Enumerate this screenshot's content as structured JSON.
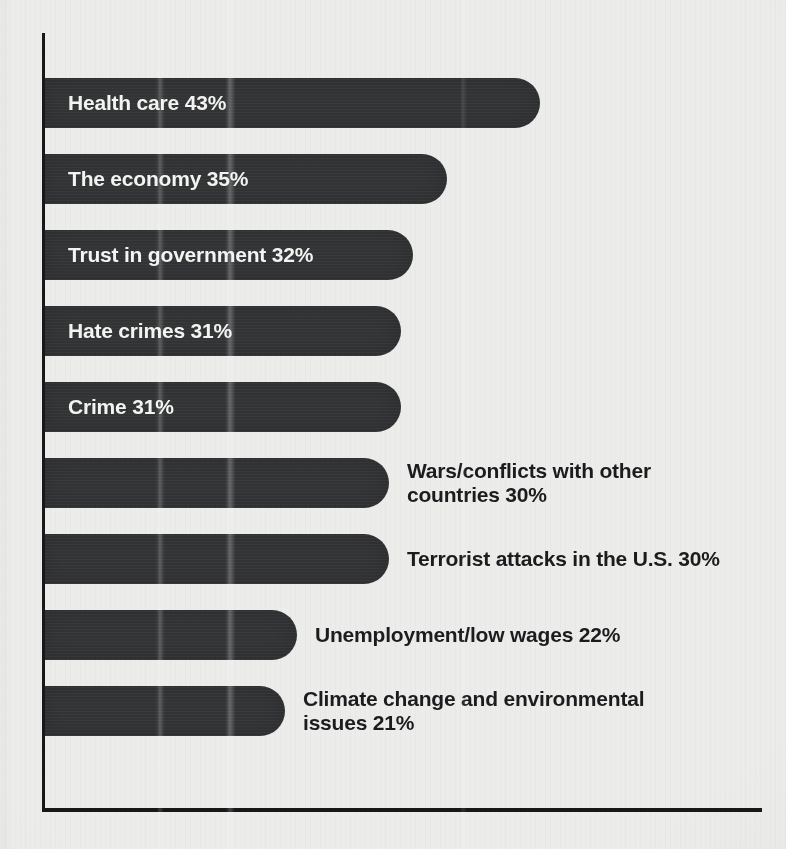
{
  "chart_data": {
    "type": "bar",
    "orientation": "horizontal",
    "title": "",
    "subtitle": "",
    "xlabel": "",
    "ylabel": "",
    "grid": false,
    "legend": null,
    "xlim": [
      0,
      43
    ],
    "unit": "%",
    "categories": [
      "Health care",
      "The economy",
      "Trust in government",
      "Hate crimes",
      "Crime",
      "Wars/conflicts with other countries",
      "Terrorist attacks in the U.S.",
      "Unemployment/low wages",
      "Climate change and environmental issues"
    ],
    "values": [
      43,
      35,
      32,
      31,
      31,
      30,
      30,
      22,
      21
    ],
    "value_labels": [
      "43%",
      "35%",
      "32%",
      "31%",
      "31%",
      "30%",
      "30%",
      "22%",
      "21%"
    ]
  },
  "colors": {
    "background": "#ececeb",
    "bar": "#333436",
    "axis": "#16181a",
    "label_on_bar": "#f4f4f2",
    "label_off_bar": "#1b1c1e"
  },
  "bars": [
    {
      "name": "health-care",
      "label_text": "Health care ",
      "value_label": "43%",
      "value": 43,
      "label_placement": "inside"
    },
    {
      "name": "the-economy",
      "label_text": "The economy ",
      "value_label": "35%",
      "value": 35,
      "label_placement": "inside"
    },
    {
      "name": "trust-in-government",
      "label_text": "Trust in government ",
      "value_label": "32%",
      "value": 32,
      "label_placement": "inside"
    },
    {
      "name": "hate-crimes",
      "label_text": "Hate crimes ",
      "value_label": "31%",
      "value": 31,
      "label_placement": "inside"
    },
    {
      "name": "crime",
      "label_text": "Crime ",
      "value_label": "31%",
      "value": 31,
      "label_placement": "inside"
    },
    {
      "name": "wars-conflicts-with-other-countries",
      "label_text": "Wars/conflicts with other\ncountries ",
      "value_label": "30%",
      "value": 30,
      "label_placement": "outside"
    },
    {
      "name": "terrorist-attacks-in-the-us",
      "label_text": "Terrorist attacks in the U.S. ",
      "value_label": "30%",
      "value": 30,
      "label_placement": "outside"
    },
    {
      "name": "unemployment-low-wages",
      "label_text": "Unemployment/low wages ",
      "value_label": "22%",
      "value": 22,
      "label_placement": "outside"
    },
    {
      "name": "climate-change-and-environmental-issues",
      "label_text": "Climate change and environmental\nissues ",
      "value_label": "21%",
      "value": 21,
      "label_placement": "outside"
    }
  ]
}
